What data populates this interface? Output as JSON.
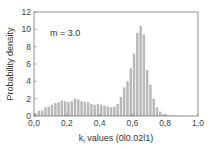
{
  "chart_data": {
    "type": "bar",
    "title": "",
    "xlabel": "k_t values (0|0.02|1)",
    "xlabel_main": "k",
    "xlabel_sub": "t",
    "xlabel_rest": " values (0l0.02l1)",
    "ylabel": "Probability density",
    "xlim": [
      0.0,
      1.0
    ],
    "ylim": [
      0,
      12
    ],
    "xticks": [
      "0,0",
      "0,2",
      "0,4",
      "0,6",
      "0,8",
      "1,0"
    ],
    "xtick_values": [
      0.0,
      0.2,
      0.4,
      0.6,
      0.8,
      1.0
    ],
    "yticks": [
      "0",
      "2",
      "4",
      "6",
      "8",
      "10",
      "12"
    ],
    "ytick_values": [
      0,
      2,
      4,
      6,
      8,
      10,
      12
    ],
    "grid": false,
    "bin_width": 0.02,
    "annotation": "m = 3.0",
    "bar_color": "#b8b8b8",
    "bins": [
      0.0,
      0.02,
      0.04,
      0.06,
      0.08,
      0.1,
      0.12,
      0.14,
      0.16,
      0.18,
      0.2,
      0.22,
      0.24,
      0.26,
      0.28,
      0.3,
      0.32,
      0.34,
      0.36,
      0.38,
      0.4,
      0.42,
      0.44,
      0.46,
      0.48,
      0.5,
      0.52,
      0.54,
      0.56,
      0.58,
      0.6,
      0.62,
      0.64,
      0.66,
      0.68,
      0.7,
      0.72,
      0.74,
      0.76,
      0.78,
      0.8,
      0.82,
      0.84,
      0.86,
      0.88,
      0.9,
      0.92,
      0.94,
      0.96,
      0.98
    ],
    "values": [
      0.3,
      0.6,
      0.6,
      1.0,
      1.1,
      1.3,
      1.5,
      1.6,
      1.8,
      1.7,
      1.6,
      1.7,
      2.0,
      1.9,
      1.7,
      1.6,
      1.6,
      1.4,
      1.3,
      1.4,
      1.3,
      1.2,
      1.1,
      1.0,
      1.1,
      1.4,
      2.2,
      3.3,
      4.0,
      5.5,
      7.2,
      9.6,
      10.4,
      9.4,
      5.3,
      3.6,
      2.0,
      1.0,
      0.5,
      0.2,
      0.1,
      0.05,
      0.05,
      0.03,
      0.03,
      0.02,
      0.02,
      0.01,
      0.01,
      0.01
    ]
  }
}
